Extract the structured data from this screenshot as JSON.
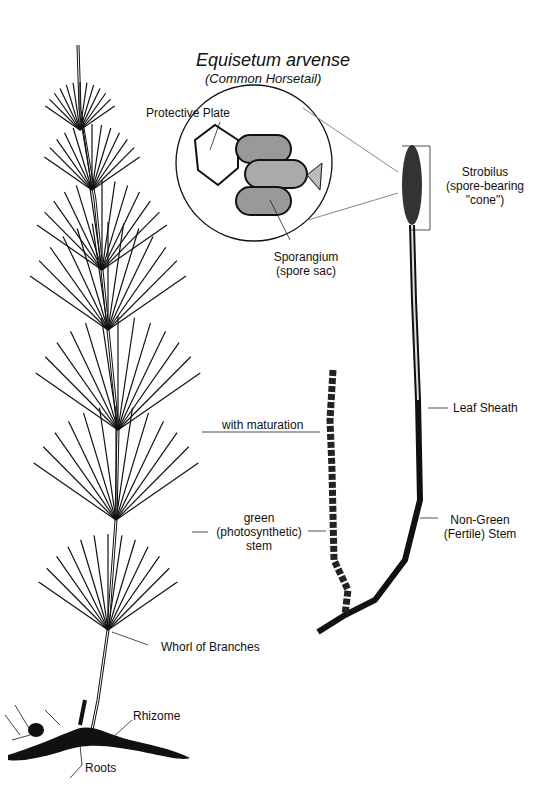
{
  "title": "Equisetum arvense",
  "subtitle": "(Common Horsetail)",
  "labels": {
    "protective_plate": "Protective Plate",
    "sporangium": "Sporangium",
    "sporangium_sub": "(spore sac)",
    "strobilus": "Strobilus",
    "strobilus_sub1": "(spore-bearing",
    "strobilus_sub2": "\"cone\")",
    "leaf_sheath": "Leaf Sheath",
    "with_maturation": "with maturation",
    "green1": "green",
    "green2": "(photosynthetic)",
    "green3": "stem",
    "nongreen1": "Non-Green",
    "nongreen2": "(Fertile) Stem",
    "whorl": "Whorl of Branches",
    "rhizome": "Rhizome",
    "roots": "Roots"
  }
}
